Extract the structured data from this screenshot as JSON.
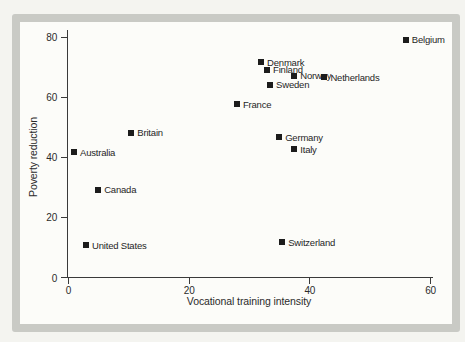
{
  "chart_data": {
    "type": "scatter",
    "title": "",
    "xlabel": "Vocational training intensity",
    "ylabel": "Poverty reduction",
    "xlim": [
      0,
      60
    ],
    "ylim": [
      0,
      80
    ],
    "xticks": [
      0,
      20,
      40,
      60
    ],
    "yticks": [
      0,
      20,
      40,
      60,
      80
    ],
    "grid": false,
    "legend": "none",
    "marker_color": "#1c1c1c",
    "points": [
      {
        "label": "Belgium",
        "x": 56,
        "y": 79
      },
      {
        "label": "Denmark",
        "x": 32,
        "y": 71.5
      },
      {
        "label": "Finland",
        "x": 33,
        "y": 69
      },
      {
        "label": "Norway",
        "x": 37.5,
        "y": 67
      },
      {
        "label": "Netherlands",
        "x": 42.5,
        "y": 66.5
      },
      {
        "label": "Sweden",
        "x": 33.5,
        "y": 64
      },
      {
        "label": "France",
        "x": 28,
        "y": 57.5
      },
      {
        "label": "Britain",
        "x": 10.5,
        "y": 48
      },
      {
        "label": "Germany",
        "x": 35,
        "y": 46.5
      },
      {
        "label": "Australia",
        "x": 1,
        "y": 41.5
      },
      {
        "label": "Italy",
        "x": 37.5,
        "y": 42.5
      },
      {
        "label": "Canada",
        "x": 5,
        "y": 29
      },
      {
        "label": "United States",
        "x": 3,
        "y": 10.5
      },
      {
        "label": "Switzerland",
        "x": 35.5,
        "y": 11.5
      }
    ],
    "colors": {
      "page_background": "#f4f4f0",
      "frame_border": "#c9cac5",
      "plot_background": "#fcfcf9",
      "axis": "#3a3a3a",
      "text": "#2b2b2b"
    }
  }
}
